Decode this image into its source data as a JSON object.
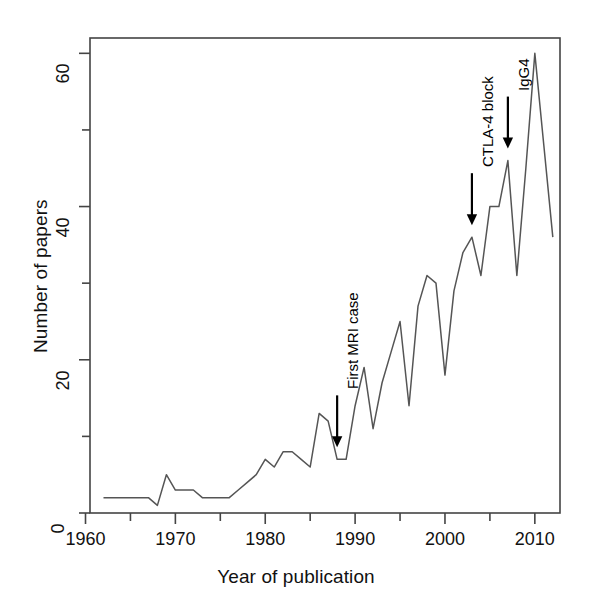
{
  "chart_data": {
    "type": "line",
    "title": "",
    "xlabel": "Year of publication",
    "ylabel": "Number of papers",
    "xlim": [
      1960.5,
      2012.8
    ],
    "ylim": [
      0,
      62
    ],
    "xticks": [
      1960,
      1970,
      1980,
      1990,
      2000,
      2010
    ],
    "xtick_labels": [
      "1960",
      "1970",
      "1980",
      "1990",
      "2000",
      "2010"
    ],
    "xminor_ticks": [
      1965,
      1975,
      1985,
      1995,
      2005
    ],
    "yticks": [
      0,
      20,
      40,
      60
    ],
    "ytick_labels": [
      "0",
      "20",
      "40",
      "60"
    ],
    "yminor_ticks": [
      10,
      30,
      50
    ],
    "grid": false,
    "legend": null,
    "line_color": "#555555",
    "x": [
      1962,
      1963,
      1964,
      1965,
      1966,
      1967,
      1968,
      1969,
      1970,
      1971,
      1972,
      1973,
      1974,
      1975,
      1976,
      1977,
      1978,
      1979,
      1980,
      1981,
      1982,
      1983,
      1984,
      1985,
      1986,
      1987,
      1988,
      1989,
      1990,
      1991,
      1992,
      1993,
      1994,
      1995,
      1996,
      1997,
      1998,
      1999,
      2000,
      2001,
      2002,
      2003,
      2004,
      2005,
      2006,
      2007,
      2008,
      2009,
      2010,
      2011,
      2012
    ],
    "values": [
      2,
      2,
      2,
      2,
      2,
      2,
      1,
      5,
      3,
      3,
      3,
      2,
      2,
      2,
      2,
      3,
      4,
      5,
      7,
      6,
      8,
      8,
      7,
      6,
      13,
      12,
      7,
      7,
      14,
      19,
      11,
      17,
      21,
      25,
      14,
      27,
      31,
      30,
      18,
      29,
      34,
      36,
      31,
      40,
      40,
      46,
      31,
      45,
      60,
      48,
      36
    ],
    "annotations": [
      {
        "label": "First MRI case",
        "year": 1988,
        "value": 7
      },
      {
        "label": "CTLA-4 block",
        "year": 2003,
        "value": 36
      },
      {
        "label": "IgG4",
        "year": 2007,
        "value": 46
      }
    ]
  },
  "axes": {
    "y_title": "Number of papers",
    "x_title": "Year of publication"
  }
}
